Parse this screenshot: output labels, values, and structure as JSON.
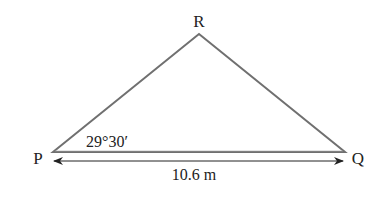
{
  "diagram": {
    "type": "triangle",
    "vertices": {
      "P": {
        "label": "P"
      },
      "Q": {
        "label": "Q"
      },
      "R": {
        "label": "R"
      }
    },
    "angle_at_P": "29°30′",
    "base_length": "10.6 m",
    "colors": {
      "triangle_stroke": "#707070",
      "text": "#222222",
      "arrow": "#222222"
    }
  }
}
